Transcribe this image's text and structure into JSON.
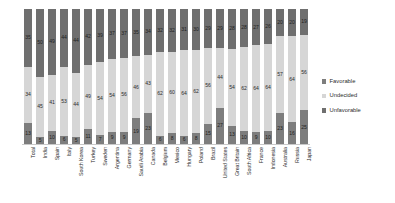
{
  "chart_data": {
    "type": "bar",
    "subtype": "stacked-column-100",
    "title": "",
    "subtitle": "",
    "xlabel": "",
    "ylabel": "",
    "ylim": [
      0,
      100
    ],
    "grid": false,
    "legend_position": "right",
    "categories": [
      "Total",
      "India",
      "Spain",
      "Italy",
      "South Korea",
      "Turkey",
      "Sweden",
      "Argentina",
      "Germany",
      "Saudi Arabia",
      "Canada",
      "Belgium",
      "Mexico",
      "Hungary",
      "Poland",
      "Brazil",
      "United States",
      "Great Britain",
      "South Africa",
      "France",
      "Indonesia",
      "Australia",
      "Russia",
      "Japan"
    ],
    "series": [
      {
        "name": "Favorable",
        "color": "#7d7d7d",
        "values": [
          34,
          45,
          41,
          53,
          44,
          49,
          54,
          54,
          56,
          46,
          43,
          62,
          60,
          64,
          62,
          56,
          44,
          54,
          62,
          64,
          64,
          57,
          64,
          56
        ]
      },
      {
        "name": "Undecided",
        "color": "#d6d6d6",
        "values": [
          13,
          5,
          10,
          6,
          5,
          11,
          7,
          9,
          9,
          19,
          23,
          6,
          8,
          6,
          8,
          15,
          27,
          13,
          10,
          9,
          10,
          23,
          16,
          25
        ]
      },
      {
        "name": "Unfavorable",
        "color": "#6f6f6f",
        "values": [
          35,
          50,
          49,
          44,
          44,
          42,
          39,
          37,
          37,
          35,
          34,
          32,
          32,
          31,
          30,
          29,
          29,
          28,
          28,
          27,
          26,
          20,
          20,
          19
        ]
      }
    ]
  },
  "legend": {
    "items": [
      {
        "label": "Favorable",
        "color": "#7d7d7d"
      },
      {
        "label": "Undecided",
        "color": "#d6d6d6"
      },
      {
        "label": "Unfavorable",
        "color": "#6f6f6f"
      }
    ]
  }
}
